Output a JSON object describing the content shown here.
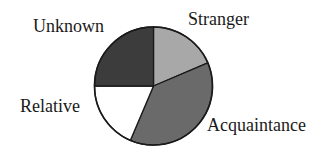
{
  "chart_data": {
    "type": "pie",
    "title": "",
    "categories": [
      "Stranger",
      "Acquaintance",
      "Relative",
      "Unknown"
    ],
    "values": [
      18.6,
      37.8,
      18.6,
      25.0
    ],
    "units": "percent (estimated from slice angles)",
    "start_angle": "12 o'clock, clockwise",
    "colors": [
      "#a8a8a8",
      "#6a6a6a",
      "#ffffff",
      "#3c3c3c"
    ],
    "legend": "none (labels placed beside slices)",
    "labels": {
      "stranger": "Stranger",
      "acquaintance": "Acquaintance",
      "relative": "Relative",
      "unknown": "Unknown"
    }
  }
}
